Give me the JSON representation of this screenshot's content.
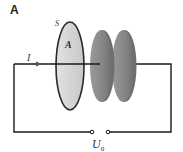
{
  "panel_label": "A",
  "labels": {
    "current": "I",
    "loop": "S",
    "area": "A",
    "voltage_main": "U",
    "voltage_sub": "0"
  },
  "colors": {
    "wire": "#1a1a1a",
    "loop_fill": "#d4d4d4",
    "loop_border": "#2a2a2a",
    "plate_fill": "#8a8a8a",
    "plate_edge": "#6a6a6a",
    "current_arrow": "#555555"
  },
  "components": [
    "loop surface S with area A",
    "capacitor plate 1",
    "capacitor plate 2",
    "voltage source terminals U0"
  ]
}
